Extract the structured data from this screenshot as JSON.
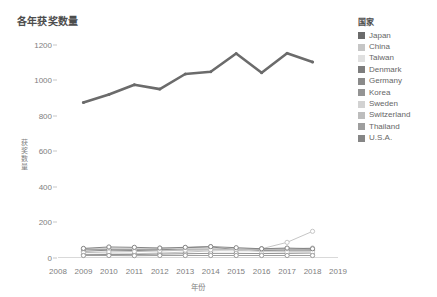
{
  "chart_data": {
    "type": "line",
    "title": "各年获奖数量",
    "xlabel": "年份",
    "ylabel": "获奖数量",
    "x": [
      2009,
      2010,
      2011,
      2012,
      2013,
      2014,
      2015,
      2016,
      2017,
      2018
    ],
    "xticks": [
      2008,
      2009,
      2010,
      2011,
      2012,
      2013,
      2014,
      2015,
      2016,
      2017,
      2018,
      2019
    ],
    "yticks": [
      0,
      200,
      400,
      600,
      800,
      1000,
      1200
    ],
    "ylim": [
      0,
      1260
    ],
    "xlim": [
      2008,
      2019
    ],
    "grid": false,
    "legend_position": "right",
    "legend_title": "国家",
    "series": [
      {
        "name": "Japan",
        "color": "#6b6b6b",
        "width": 2.6,
        "marker": false,
        "values": [
          875,
          920,
          975,
          950,
          1035,
          1048,
          1150,
          1042,
          1152,
          1103
        ]
      },
      {
        "name": "China",
        "color": "#c6c6c6",
        "width": 1.0,
        "marker": true,
        "values": [
          20,
          22,
          24,
          28,
          33,
          40,
          46,
          52,
          88,
          150
        ]
      },
      {
        "name": "Taiwan",
        "color": "#e0e0e0",
        "width": 1.0,
        "marker": true,
        "values": [
          46,
          50,
          47,
          45,
          44,
          42,
          40,
          38,
          40,
          42
        ]
      },
      {
        "name": "Denmark",
        "color": "#7d7d7d",
        "width": 1.0,
        "marker": true,
        "values": [
          50,
          50,
          50,
          50,
          50,
          50,
          50,
          50,
          50,
          50
        ]
      },
      {
        "name": "Germany",
        "color": "#8a8a8a",
        "width": 1.0,
        "marker": true,
        "values": [
          38,
          44,
          42,
          44,
          58,
          63,
          46,
          42,
          40,
          40
        ]
      },
      {
        "name": "Korea",
        "color": "#949494",
        "width": 1.0,
        "marker": true,
        "values": [
          18,
          20,
          19,
          22,
          24,
          26,
          26,
          25,
          26,
          28
        ]
      },
      {
        "name": "Sweden",
        "color": "#d2d2d2",
        "width": 1.0,
        "marker": true,
        "values": [
          52,
          56,
          54,
          56,
          52,
          50,
          48,
          36,
          34,
          33
        ]
      },
      {
        "name": "Switzerland",
        "color": "#bdbdbd",
        "width": 1.0,
        "marker": true,
        "values": [
          30,
          34,
          36,
          40,
          44,
          46,
          48,
          46,
          52,
          56
        ]
      },
      {
        "name": "Thailand",
        "color": "#9e9e9e",
        "width": 1.0,
        "marker": true,
        "values": [
          14,
          14,
          13,
          14,
          14,
          14,
          14,
          14,
          14,
          14
        ]
      },
      {
        "name": "U.S.A.",
        "color": "#868686",
        "width": 1.0,
        "marker": true,
        "values": [
          54,
          62,
          60,
          56,
          60,
          64,
          58,
          52,
          56,
          52
        ]
      }
    ]
  }
}
